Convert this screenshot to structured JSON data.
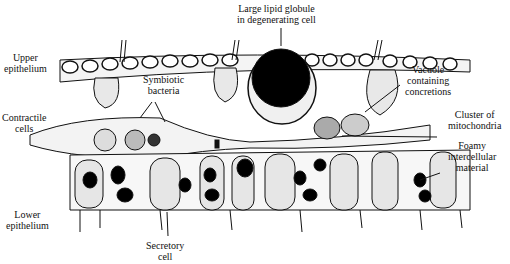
{
  "figure": {
    "labels": {
      "upper_epithelium": [
        "Upper",
        "epithelium"
      ],
      "contractile_cells": [
        "Contractile",
        "cells"
      ],
      "lower_epithelium": [
        "Lower",
        "epithelium"
      ],
      "lipid_globule": [
        "Large lipid globule",
        "in degenerating cell"
      ],
      "symbiotic_bacteria": [
        "Symbiotic",
        "bacteria"
      ],
      "vacuole": [
        "Vacuole",
        "containing",
        "concretions"
      ],
      "mitochondria": [
        "Cluster of",
        "mitochondria"
      ],
      "foamy": [
        "Foamy",
        "intercellular",
        "material"
      ],
      "secretory": [
        "Secretory",
        "cell"
      ]
    }
  }
}
